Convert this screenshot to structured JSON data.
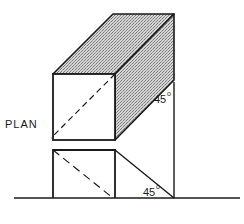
{
  "diagram": {
    "type": "oblique projection of a rectangular prism with plan view",
    "labels": {
      "plan": "PLAN",
      "angle_upper": "45",
      "angle_lower": "45",
      "degree_symbol": "o"
    },
    "colors": {
      "line": "#1a1a1a",
      "shading_light": "#d9d9d9",
      "shading_dark": "#8a8a8a",
      "background": "#ffffff"
    }
  }
}
